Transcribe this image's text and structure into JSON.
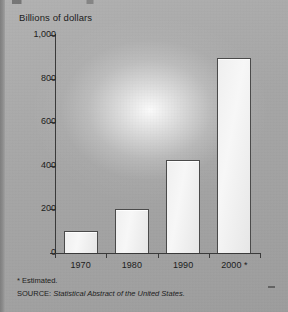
{
  "chart_data": {
    "type": "bar",
    "title": "",
    "subtitle": "",
    "ylabel": "Billions of dollars",
    "xlabel": "",
    "categories": [
      "1970",
      "1980",
      "1990",
      "2000 *"
    ],
    "values": [
      100,
      200,
      425,
      895
    ],
    "ylim": [
      0,
      1000
    ],
    "yticks": [
      0,
      200,
      400,
      600,
      800,
      1000
    ],
    "ytick_labels": [
      "0",
      "200",
      "400",
      "600",
      "800",
      "1,000"
    ],
    "grid": false,
    "legend": null,
    "bar_fill_color": "#f2f2f2",
    "bar_edge_color": "#4a4a4a",
    "background_color": "#a9a9a9",
    "text_color": "#1c1c1c"
  },
  "axis": {
    "y_title": "Billions of dollars"
  },
  "footnotes": {
    "estimated": "* Estimated.",
    "source_label": "SOURCE:",
    "source_text": "Statistical Abstract of the United States."
  }
}
